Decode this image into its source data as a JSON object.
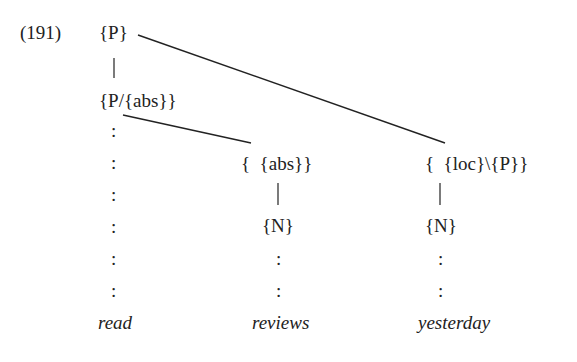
{
  "example": {
    "number": "(191)"
  },
  "tree": {
    "root": "{P}",
    "functor": "{P/{abs}}",
    "abs_node": "{  {abs}}",
    "loc_node": "{  {loc}\\{P}}",
    "n_reviews": "{N}",
    "n_yesterday": "{N}",
    "unary_bar": "|",
    "colon": ":"
  },
  "words": {
    "read": "read",
    "reviews": "reviews",
    "yesterday": "yesterday"
  }
}
